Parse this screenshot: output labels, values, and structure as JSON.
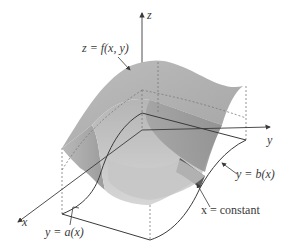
{
  "figure": {
    "type": "3d-surface-diagram",
    "axes": {
      "x_label": "x",
      "y_label": "y",
      "z_label": "z"
    },
    "labels": {
      "surface": "z = f(x, y)",
      "upper_boundary": "y = b(x)",
      "lower_boundary": "y = a(x)",
      "slice": "x = constant"
    },
    "colors": {
      "line": "#3a3a3a",
      "dashed": "#7a7a7a",
      "surface_light": "#c9c9c9",
      "surface_mid": "#a8a8a8",
      "surface_dark": "#7c7c7c",
      "slice_dark": "#5e5e5e",
      "background": "#ffffff"
    }
  }
}
